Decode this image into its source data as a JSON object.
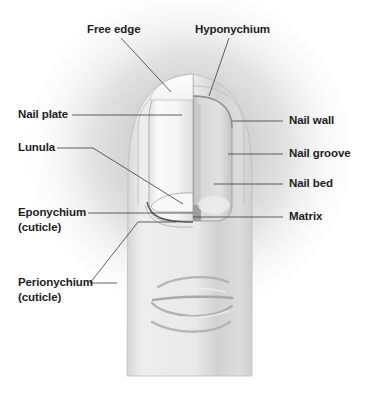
{
  "diagram": {
    "colors": {
      "background": "#ffffff",
      "halo": "#9a9a9a",
      "skin_light": "#ececec",
      "skin_shadow": "#c8c8c8",
      "nail_plate": "#ffffff",
      "nail_bed": "#dcdcdc",
      "leader_line": "#3a3a3a",
      "label_text": "#1e1e1e"
    },
    "labels": {
      "free_edge": "Free edge",
      "hyponychium": "Hyponychium",
      "nail_plate": "Nail plate",
      "lunula": "Lunula",
      "eponychium": "Eponychium",
      "eponychium_sub": "(cuticle)",
      "perionychium": "Perionychium",
      "perionychium_sub": "(cuticle)",
      "nail_wall": "Nail wall",
      "nail_groove": "Nail groove",
      "nail_bed": "Nail bed",
      "matrix": "Matrix"
    }
  }
}
